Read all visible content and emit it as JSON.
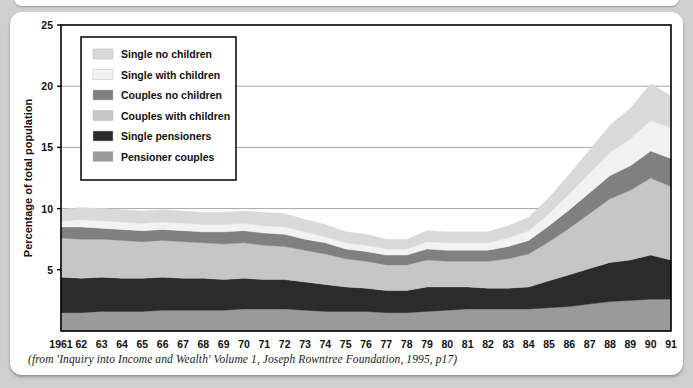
{
  "figure": {
    "caption": "(from 'Inquiry into Income and Wealth' Volume 1, Joseph Rowntree Foundation, 1995, p17)"
  },
  "colors": {
    "background": "#cfcfcf",
    "card": "#ffffff",
    "axis": "#000000",
    "gridline": "#a8a8a8",
    "single_no_children": "#d9d9d9",
    "single_with_children": "#f2f2f2",
    "couples_no_children": "#808080",
    "couples_with_children": "#c6c6c6",
    "single_pensioners": "#2b2b2b",
    "pensioner_couples": "#9a9a9a"
  },
  "legend": {
    "position": "upper-left-inside",
    "entries": [
      {
        "label": "Single no children",
        "color": "#d9d9d9",
        "swatch": "legend-swatch"
      },
      {
        "label": "Single with children",
        "color": "#f2f2f2",
        "swatch": "legend-swatch"
      },
      {
        "label": "Couples no children",
        "color": "#808080",
        "swatch": "legend-swatch"
      },
      {
        "label": "Couples with children",
        "color": "#c6c6c6",
        "swatch": "legend-swatch"
      },
      {
        "label": "Single pensioners",
        "color": "#2b2b2b",
        "swatch": "legend-swatch"
      },
      {
        "label": "Pensioner couples",
        "color": "#9a9a9a",
        "swatch": "legend-swatch"
      }
    ]
  },
  "chart_data": {
    "type": "area",
    "stacked": true,
    "title": "",
    "subtitle": "",
    "xlabel": "",
    "ylabel": "Percentage of total population",
    "xlim": [
      1961,
      1991
    ],
    "ylim": [
      0,
      25
    ],
    "yticks": [
      5,
      10,
      15,
      20,
      25
    ],
    "ytick_labels": [
      "5",
      "10",
      "15",
      "20",
      "25"
    ],
    "grid": "horizontal",
    "x": [
      1961,
      1962,
      1963,
      1964,
      1965,
      1966,
      1967,
      1968,
      1969,
      1970,
      1971,
      1972,
      1973,
      1974,
      1975,
      1976,
      1977,
      1978,
      1979,
      1980,
      1981,
      1982,
      1983,
      1984,
      1985,
      1986,
      1987,
      1988,
      1989,
      1990,
      1991
    ],
    "xtick_labels": [
      "1961",
      "62",
      "63",
      "64",
      "65",
      "66",
      "67",
      "68",
      "69",
      "70",
      "71",
      "72",
      "73",
      "74",
      "75",
      "76",
      "77",
      "78",
      "79",
      "80",
      "81",
      "82",
      "83",
      "84",
      "85",
      "86",
      "87",
      "88",
      "89",
      "90",
      "91"
    ],
    "stack_order_bottom_to_top": [
      "Pensioner couples",
      "Single pensioners",
      "Couples with children",
      "Couples no children",
      "Single with children",
      "Single no children"
    ],
    "series": [
      {
        "name": "Pensioner couples",
        "color": "#9a9a9a",
        "values": [
          1.5,
          1.5,
          1.6,
          1.6,
          1.6,
          1.7,
          1.7,
          1.7,
          1.7,
          1.8,
          1.8,
          1.8,
          1.7,
          1.6,
          1.6,
          1.6,
          1.5,
          1.5,
          1.6,
          1.7,
          1.8,
          1.8,
          1.8,
          1.8,
          1.9,
          2.0,
          2.2,
          2.4,
          2.5,
          2.6,
          2.6
        ]
      },
      {
        "name": "Single pensioners",
        "color": "#2b2b2b",
        "values": [
          2.9,
          2.8,
          2.8,
          2.7,
          2.7,
          2.7,
          2.6,
          2.6,
          2.5,
          2.5,
          2.4,
          2.4,
          2.3,
          2.2,
          2.0,
          1.9,
          1.8,
          1.8,
          2.0,
          1.9,
          1.8,
          1.7,
          1.7,
          1.8,
          2.2,
          2.6,
          2.9,
          3.2,
          3.3,
          3.6,
          3.2
        ]
      },
      {
        "name": "Couples with children",
        "color": "#c6c6c6",
        "values": [
          3.2,
          3.2,
          3.1,
          3.1,
          3.0,
          3.0,
          3.0,
          2.9,
          2.9,
          2.9,
          2.8,
          2.7,
          2.6,
          2.5,
          2.3,
          2.2,
          2.1,
          2.1,
          2.2,
          2.1,
          2.1,
          2.2,
          2.4,
          2.7,
          3.2,
          3.8,
          4.5,
          5.2,
          5.7,
          6.3,
          6.0
        ]
      },
      {
        "name": "Couples no children",
        "color": "#808080",
        "values": [
          0.9,
          1.0,
          0.9,
          0.9,
          0.9,
          0.9,
          0.9,
          0.9,
          1.0,
          1.0,
          1.0,
          1.0,
          0.9,
          0.9,
          0.8,
          0.8,
          0.8,
          0.8,
          0.9,
          0.9,
          0.9,
          0.9,
          1.0,
          1.1,
          1.3,
          1.5,
          1.7,
          1.9,
          2.0,
          2.2,
          2.3
        ]
      },
      {
        "name": "Single with children",
        "color": "#f2f2f2",
        "values": [
          0.5,
          0.6,
          0.6,
          0.6,
          0.6,
          0.6,
          0.6,
          0.6,
          0.6,
          0.6,
          0.6,
          0.6,
          0.6,
          0.5,
          0.5,
          0.5,
          0.5,
          0.5,
          0.6,
          0.6,
          0.6,
          0.6,
          0.7,
          0.8,
          1.0,
          1.3,
          1.6,
          1.9,
          2.2,
          2.5,
          2.5
        ]
      },
      {
        "name": "Single no children",
        "color": "#d9d9d9",
        "values": [
          0.9,
          1.0,
          1.0,
          1.0,
          1.0,
          1.0,
          1.0,
          1.0,
          1.0,
          1.0,
          1.1,
          1.1,
          1.0,
          1.0,
          0.9,
          0.9,
          0.8,
          0.8,
          0.9,
          0.9,
          0.9,
          0.9,
          1.0,
          1.1,
          1.3,
          1.6,
          1.9,
          2.2,
          2.5,
          3.0,
          2.6
        ]
      }
    ],
    "totals": [
      9.9,
      10.1,
      10.0,
      9.9,
      9.8,
      9.9,
      9.8,
      9.7,
      9.7,
      9.8,
      9.7,
      9.6,
      9.1,
      8.7,
      8.1,
      7.9,
      7.5,
      7.5,
      8.2,
      8.1,
      8.1,
      8.1,
      8.6,
      9.3,
      10.9,
      12.8,
      14.8,
      16.8,
      18.2,
      20.2,
      19.2
    ]
  }
}
